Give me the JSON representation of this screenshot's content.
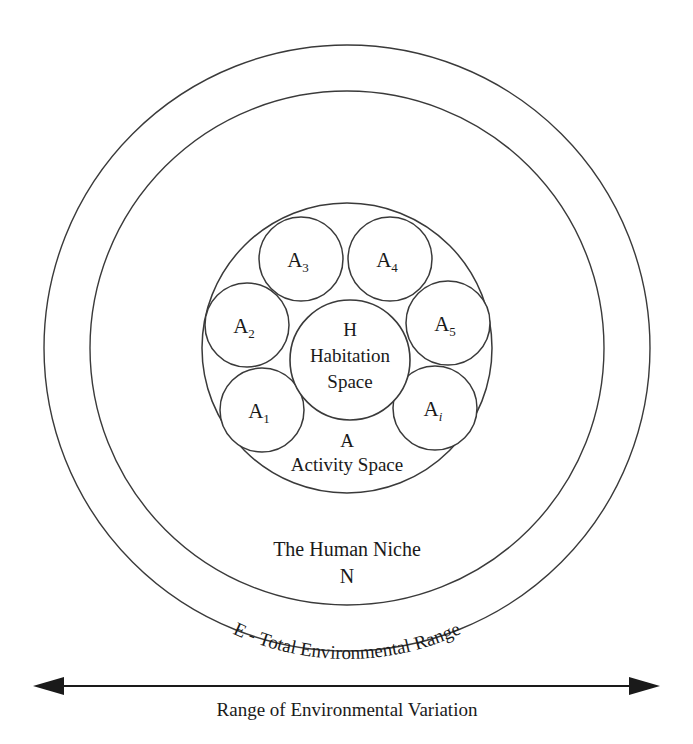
{
  "diagram": {
    "title": "The Human Niche",
    "rings": {
      "outer_label_text": "E - Total Environmental Range",
      "niche_name": "The Human Niche",
      "niche_symbol": "N"
    },
    "activity": {
      "symbol": "A",
      "name": "Activity Space"
    },
    "habitation": {
      "symbol": "H",
      "name_line1": "Habitation",
      "name_line2": "Space"
    },
    "satellites": [
      {
        "base": "A",
        "sub": "1",
        "italic_sub": false
      },
      {
        "base": "A",
        "sub": "2",
        "italic_sub": false
      },
      {
        "base": "A",
        "sub": "3",
        "italic_sub": false
      },
      {
        "base": "A",
        "sub": "4",
        "italic_sub": false
      },
      {
        "base": "A",
        "sub": "5",
        "italic_sub": false
      },
      {
        "base": "A",
        "sub": "i",
        "italic_sub": true
      }
    ],
    "axis": {
      "caption": "Range of Environmental Variation"
    },
    "colors": {
      "stroke": "#3a3a3a",
      "text": "#1a1a1a",
      "background": "#ffffff",
      "axis": "#1a1a1a"
    }
  }
}
